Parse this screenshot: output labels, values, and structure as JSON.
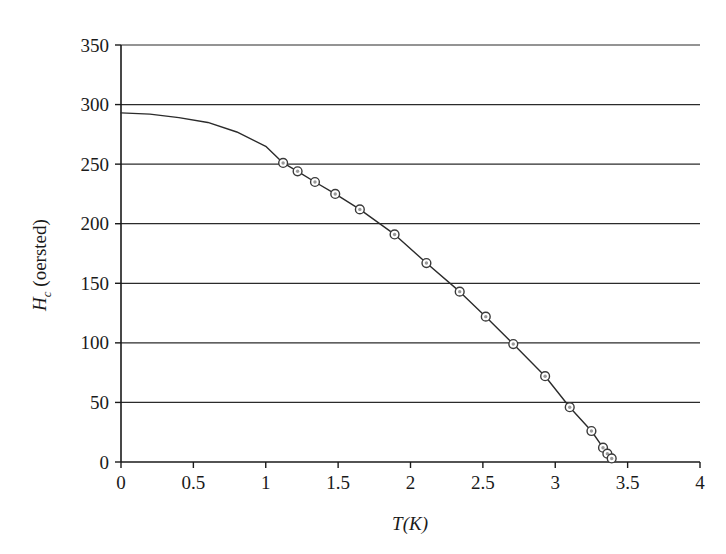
{
  "chart_data": {
    "type": "line",
    "title": "",
    "subtitle": "",
    "xlabel": "T(K)",
    "xlabel_parts": {
      "symbol": "T",
      "units": "(K)"
    },
    "ylabel": "Hc (oersted)",
    "ylabel_parts": {
      "symbol": "H",
      "subscript": "c",
      "units": "(oersted)"
    },
    "xlim": [
      0,
      4
    ],
    "ylim": [
      0,
      350
    ],
    "xticks": [
      0,
      0.5,
      1,
      1.5,
      2,
      2.5,
      3,
      3.5,
      4
    ],
    "xtick_labels": [
      "0",
      "0.5",
      "1",
      "1.5",
      "2",
      "2.5",
      "3",
      "3.5",
      "4"
    ],
    "yticks": [
      0,
      50,
      100,
      150,
      200,
      250,
      300,
      350
    ],
    "ytick_labels": [
      "0",
      "50",
      "100",
      "150",
      "200",
      "250",
      "300",
      "350"
    ],
    "grid": {
      "horizontal": true,
      "vertical": false
    },
    "legend": {
      "visible": false,
      "position": "none"
    },
    "series": [
      {
        "name": "fitted curve",
        "kind": "line",
        "marker": "none",
        "color": "#2b2b2b",
        "linewidth": 1.4,
        "x": [
          0.0,
          0.2,
          0.4,
          0.6,
          0.8,
          1.0,
          1.12,
          1.22,
          1.34,
          1.48,
          1.65,
          1.89,
          2.11,
          2.34,
          2.52,
          2.71,
          2.93,
          3.1,
          3.25,
          3.33,
          3.36,
          3.39
        ],
        "y": [
          293,
          292,
          289,
          285,
          277,
          265,
          251,
          244,
          235,
          225,
          212,
          191,
          167,
          143,
          122,
          99,
          72,
          46,
          26,
          12,
          7,
          3
        ]
      },
      {
        "name": "measured points",
        "kind": "scatter",
        "marker": "circle-dot",
        "color": "#3a3a3a",
        "x": [
          1.12,
          1.22,
          1.34,
          1.48,
          1.65,
          1.89,
          2.11,
          2.34,
          2.52,
          2.71,
          2.93,
          3.1,
          3.25,
          3.33,
          3.36,
          3.39
        ],
        "y": [
          251,
          244,
          235,
          225,
          212,
          191,
          167,
          143,
          122,
          99,
          72,
          46,
          26,
          12,
          7,
          3
        ]
      }
    ]
  },
  "colors": {
    "axis": "#1a1a1a",
    "grid": "#2b2b2b",
    "curve": "#2b2b2b",
    "marker_stroke": "#3a3a3a",
    "marker_fill": "#9a9a9a",
    "background": "#ffffff"
  }
}
